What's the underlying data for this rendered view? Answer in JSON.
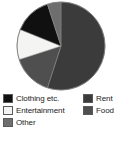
{
  "chart_data": {
    "type": "pie",
    "title": "",
    "subtitle": "",
    "xlabel": "",
    "ylabel": "",
    "legend_position": "bottom",
    "grid": false,
    "categories": [
      "Rent",
      "Food",
      "Entertainment",
      "Clothing etc.",
      "Other"
    ],
    "values": [
      55,
      15,
      11,
      14,
      5
    ],
    "units": "percent",
    "slices": [
      {
        "label": "Rent",
        "value": 55,
        "color": "#3b3b3b",
        "start_angle": 0,
        "end_angle": 198,
        "swatch_name": "legend-swatch-rent"
      },
      {
        "label": "Food",
        "value": 15,
        "color": "#4f4f4f",
        "start_angle": 198,
        "end_angle": 252,
        "swatch_name": "legend-swatch-food"
      },
      {
        "label": "Entertainment",
        "value": 11,
        "color": "#f4f4f2",
        "start_angle": 252,
        "end_angle": 292,
        "swatch_name": "legend-swatch-entertainment"
      },
      {
        "label": "Clothing etc.",
        "value": 14,
        "color": "#101010",
        "start_angle": 292,
        "end_angle": 342,
        "swatch_name": "legend-swatch-clothing"
      },
      {
        "label": "Other",
        "value": 5,
        "color": "#6e6e6e",
        "start_angle": 342,
        "end_angle": 360,
        "swatch_name": "legend-swatch-other"
      }
    ]
  },
  "legend": {
    "left_column": [
      {
        "label": "Clothing etc.",
        "color": "#101010"
      },
      {
        "label": "Entertainment",
        "color": "#f4f4f2"
      },
      {
        "label": "Other",
        "color": "#6e6e6e"
      }
    ],
    "right_column": [
      {
        "label": "Rent",
        "color": "#3b3b3b"
      },
      {
        "label": "Food",
        "color": "#4f4f4f"
      }
    ]
  },
  "colors": {
    "background": "#ffffff",
    "pie_outline": "#7a7a7a",
    "swatch_border": "#5a5a5a",
    "text": "#1c1c1c"
  }
}
